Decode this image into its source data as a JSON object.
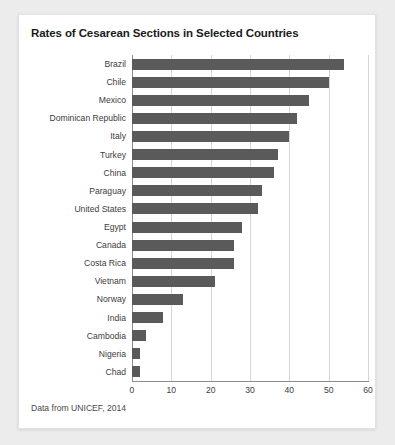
{
  "card": {
    "title": "Rates of Cesarean Sections in Selected Countries",
    "source_note": "Data from UNICEF, 2014"
  },
  "colors": {
    "bar": "#5a5a5a",
    "grid": "#d5d5d5",
    "axis": "#8e8e8e",
    "card_background": "#ffffff",
    "page_background": "#ececed",
    "text": "#3d3d3d"
  },
  "chart_data": {
    "type": "bar",
    "orientation": "horizontal",
    "title": "Rates of Cesarean Sections in Selected Countries",
    "xlabel": "",
    "ylabel": "",
    "xlim": [
      0,
      60
    ],
    "ylim": null,
    "grid": true,
    "legend": null,
    "xticks": [
      0,
      10,
      20,
      30,
      40,
      50,
      60
    ],
    "xtick_labels": [
      "0",
      "10",
      "20",
      "30",
      "40",
      "50",
      "60"
    ],
    "categories": [
      "Brazil",
      "Chile",
      "Mexico",
      "Dominican Republic",
      "Italy",
      "Turkey",
      "China",
      "Paraguay",
      "United States",
      "Egypt",
      "Canada",
      "Costa Rica",
      "Vietnam",
      "Norway",
      "India",
      "Cambodia",
      "Nigeria",
      "Chad"
    ],
    "values": [
      54,
      50,
      45,
      42,
      40,
      37,
      36,
      33,
      32,
      28,
      26,
      26,
      21,
      13,
      8,
      3.5,
      2,
      2
    ],
    "note": "Data from UNICEF, 2014"
  }
}
